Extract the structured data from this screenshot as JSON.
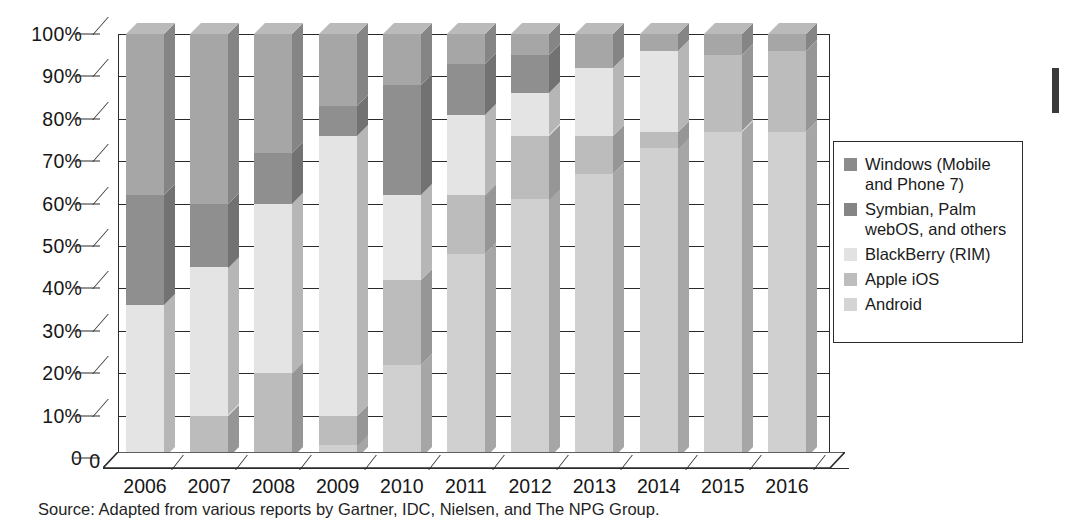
{
  "chart_data": {
    "type": "bar",
    "variant": "stacked-100-percent-3d",
    "title": "",
    "xlabel": "",
    "ylabel": "",
    "ylim": [
      0,
      100
    ],
    "ytick_labels": [
      "0",
      "10%",
      "20%",
      "30%",
      "40%",
      "50%",
      "60%",
      "70%",
      "80%",
      "90%",
      "100%"
    ],
    "ytick_values": [
      0,
      10,
      20,
      30,
      40,
      50,
      60,
      70,
      80,
      90,
      100
    ],
    "grid": true,
    "legend_position": "right",
    "categories": [
      "2006",
      "2007",
      "2008",
      "2009",
      "2010",
      "2011",
      "2012",
      "2013",
      "2014",
      "2015",
      "2016"
    ],
    "series": [
      {
        "name": "Android",
        "color": "#d0d0d0",
        "values": [
          0,
          0,
          0,
          3,
          22,
          48,
          61,
          67,
          73,
          77,
          77
        ]
      },
      {
        "name": "Apple iOS",
        "color": "#bcbcbc",
        "values": [
          0,
          10,
          20,
          7,
          20,
          14,
          15,
          9,
          4,
          18,
          19
        ]
      },
      {
        "name": "BlackBerry (RIM)",
        "color": "#e4e4e4",
        "values": [
          36,
          35,
          40,
          66,
          20,
          19,
          10,
          16,
          19,
          0,
          0
        ]
      },
      {
        "name": "Symbian, Palm\nwebOS, and others",
        "color": "#8f8f8f",
        "values": [
          26,
          15,
          12,
          7,
          26,
          12,
          9,
          0,
          0,
          0,
          0
        ]
      },
      {
        "name": "Windows (Mobile\nand Phone 7)",
        "color": "#a6a6a6",
        "values": [
          38,
          40,
          28,
          17,
          12,
          7,
          5,
          8,
          4,
          5,
          4
        ]
      }
    ],
    "annotations": {
      "source": "Source: Adapted from various reports by Gartner, IDC, Nielsen, and The NPG Group."
    }
  },
  "legend": {
    "items": [
      {
        "label": "Windows (Mobile\nand Phone 7)",
        "swatch": "#8b8b8b"
      },
      {
        "label": "Symbian, Palm\nwebOS, and others",
        "swatch": "#858585"
      },
      {
        "label": "BlackBerry (RIM)",
        "swatch": "#e2e2e2"
      },
      {
        "label": "Apple iOS",
        "swatch": "#bdbdbd"
      },
      {
        "label": "Android",
        "swatch": "#d4d4d4"
      }
    ]
  },
  "source_note": "Source: Adapted from various reports by Gartner, IDC, Nielsen, and The NPG Group.",
  "axis": {
    "zero_label": "0"
  }
}
